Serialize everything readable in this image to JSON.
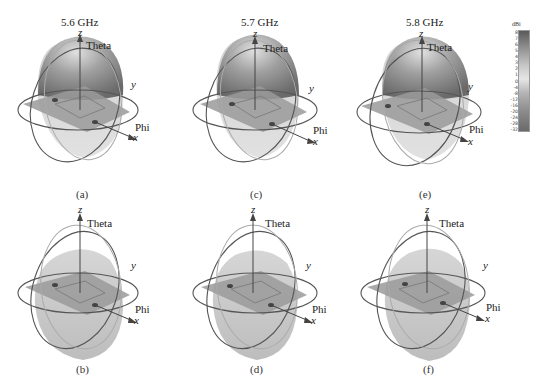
{
  "figure": {
    "panels": [
      {
        "id": "a",
        "caption": "(a)",
        "frequency": "5.6 GHz",
        "row": 0,
        "col": 0,
        "view": "gain-pattern-upper"
      },
      {
        "id": "c",
        "caption": "(c)",
        "frequency": "5.7 GHz",
        "row": 0,
        "col": 1,
        "view": "gain-pattern-upper"
      },
      {
        "id": "e",
        "caption": "(e)",
        "frequency": "5.8 GHz",
        "row": 0,
        "col": 2,
        "view": "gain-pattern-upper"
      },
      {
        "id": "b",
        "caption": "(b)",
        "frequency": "",
        "row": 1,
        "col": 0,
        "view": "gain-pattern-lower"
      },
      {
        "id": "d",
        "caption": "(d)",
        "frequency": "",
        "row": 1,
        "col": 1,
        "view": "gain-pattern-lower"
      },
      {
        "id": "f",
        "caption": "(f)",
        "frequency": "",
        "row": 1,
        "col": 2,
        "view": "gain-pattern-lower"
      }
    ],
    "axis_labels": {
      "z": "z",
      "y": "y",
      "x": "x",
      "theta": "Theta",
      "phi": "Phi"
    },
    "colorbar": {
      "unit": "dBi",
      "ticks": [
        "8",
        "7",
        "6",
        "5",
        "4",
        "3",
        "2",
        "1",
        "0",
        "-4",
        "-8",
        "-12",
        "-16",
        "-20",
        "-24",
        "-28",
        "-32"
      ]
    },
    "colors": {
      "pattern_dark": "#6e6e6e",
      "pattern_light": "#d2d2d2",
      "ring": "#555555",
      "ring_light": "#aaaaaa",
      "substrate": "#9a9a9a"
    }
  }
}
